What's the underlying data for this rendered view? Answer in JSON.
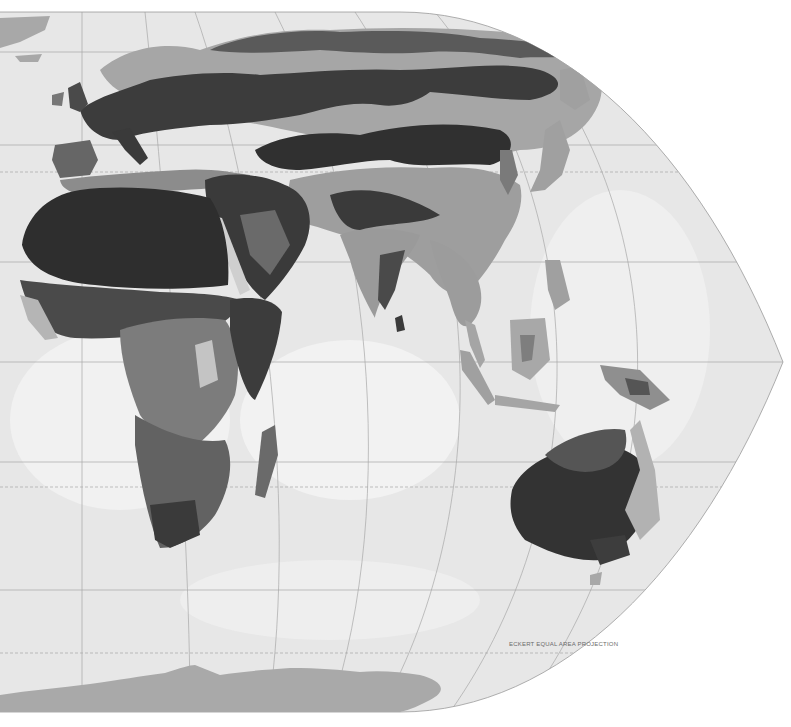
{
  "map": {
    "projection_label": "ECKERT EQUAL AREA PROJECTION",
    "style": "grayscale climate / vegetation regions",
    "colors": {
      "paper": "#ffffff",
      "ocean": "#e6e6e6",
      "ocean_light": "#f3f3f3",
      "graticule": "#a8a8a8",
      "class_1_darkest": "#2e2e2e",
      "class_2_dark": "#4a4a4a",
      "class_3_mid_dark": "#5f5f5f",
      "class_4_mid": "#7d7d7d",
      "class_5_light": "#a6a6a6",
      "class_6_lightest": "#c6c6c6",
      "antarctica": "#a9a9a9"
    },
    "regions_visible": [
      "Europe",
      "Africa",
      "Middle East",
      "Asia",
      "India",
      "Southeast Asia",
      "Indonesia",
      "Japan",
      "Australia",
      "New Zealand",
      "Madagascar",
      "Antarctica"
    ],
    "graticule_parallels_y": [
      52,
      145,
      172,
      262,
      362,
      462,
      487,
      590,
      653
    ]
  }
}
